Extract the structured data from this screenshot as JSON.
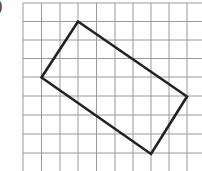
{
  "figure": {
    "label": ")",
    "grid": {
      "x_lines": [
        23,
        41.5,
        60,
        78,
        96.5,
        115,
        133,
        151,
        169,
        187
      ],
      "y_lines": [
        3,
        21.5,
        40,
        58.5,
        77,
        96,
        115,
        134,
        153
      ],
      "x_extent": [
        23,
        202
      ],
      "y_extent": [
        3,
        171
      ],
      "color": "#9a9a9a"
    },
    "shape": {
      "type": "rectangle",
      "vertices": [
        [
          78,
          21.5
        ],
        [
          187,
          96.5
        ],
        [
          151,
          154
        ],
        [
          41.5,
          77.5
        ]
      ],
      "stroke": "#222222",
      "stroke_width": 2.6
    }
  }
}
